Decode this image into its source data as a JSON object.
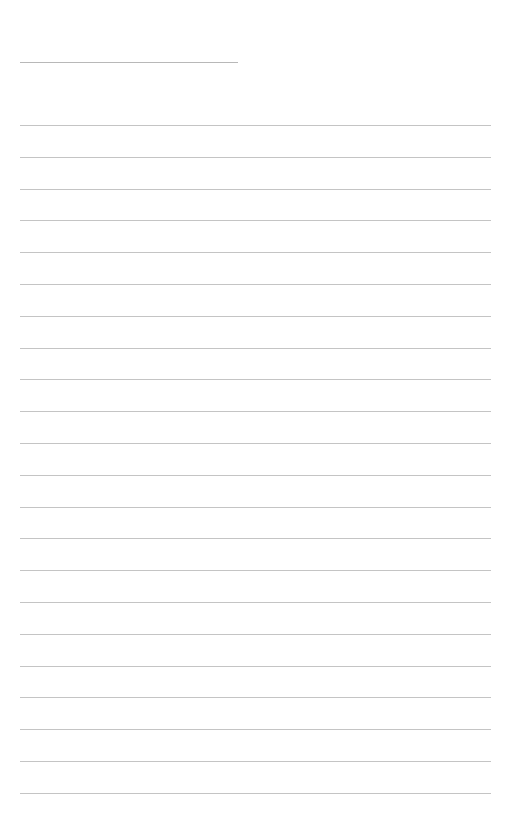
{
  "document": {
    "type": "lined-paper",
    "title_line": {
      "text": ""
    },
    "lines": [
      {
        "text": ""
      },
      {
        "text": ""
      },
      {
        "text": ""
      },
      {
        "text": ""
      },
      {
        "text": ""
      },
      {
        "text": ""
      },
      {
        "text": ""
      },
      {
        "text": ""
      },
      {
        "text": ""
      },
      {
        "text": ""
      },
      {
        "text": ""
      },
      {
        "text": ""
      },
      {
        "text": ""
      },
      {
        "text": ""
      },
      {
        "text": ""
      },
      {
        "text": ""
      },
      {
        "text": ""
      },
      {
        "text": ""
      },
      {
        "text": ""
      },
      {
        "text": ""
      },
      {
        "text": ""
      },
      {
        "text": ""
      }
    ],
    "colors": {
      "background": "#ffffff",
      "rule": "#c4c4c4"
    }
  }
}
